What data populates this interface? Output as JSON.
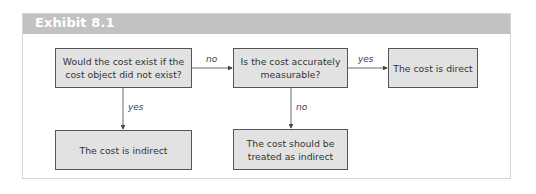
{
  "exhibit": {
    "title": "Exhibit 8.1"
  },
  "diagram": {
    "type": "flowchart",
    "nodes": [
      {
        "id": "q1",
        "label": "Would the cost exist if the cost object did not exist?"
      },
      {
        "id": "q2",
        "label": "Is the cost accurately measurable?"
      },
      {
        "id": "direct",
        "label": "The cost is direct"
      },
      {
        "id": "indirect",
        "label": "The cost is indirect"
      },
      {
        "id": "treat_indirect",
        "label": "The cost should be treated as indirect"
      }
    ],
    "edges": [
      {
        "from": "q1",
        "to": "q2",
        "label": "no"
      },
      {
        "from": "q2",
        "to": "direct",
        "label": "yes"
      },
      {
        "from": "q1",
        "to": "indirect",
        "label": "yes"
      },
      {
        "from": "q2",
        "to": "treat_indirect",
        "label": "no"
      }
    ]
  },
  "colors": {
    "header": "#c2c2c2",
    "node_fill": "#e2e2e2",
    "node_border": "#555555",
    "line": "#444444"
  }
}
